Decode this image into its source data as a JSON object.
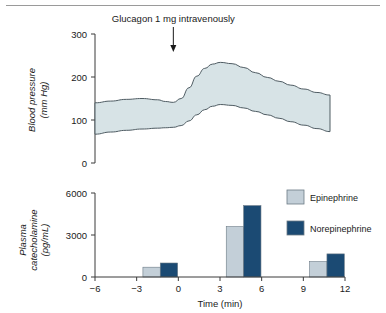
{
  "figure": {
    "annotation": "Glucagon 1 mg intravenously",
    "colors": {
      "band_fill": "#d7e3e6",
      "band_stroke": "#4f5c63",
      "epinephrine": "#c3cfd8",
      "norepinephrine": "#1b4a73",
      "axis": "#3a3a3a",
      "rule": "#9a9a9a"
    }
  },
  "chart_data": [
    {
      "id": "blood-pressure",
      "type": "area",
      "title": "",
      "xlabel": "",
      "ylabel": "Blood pressure (mm Hg)",
      "ylabel_line1": "Blood pressure",
      "ylabel_line2": "(mm Hg)",
      "ytick_labels": [
        "0",
        "100",
        "200",
        "300"
      ],
      "ytick_values": [
        0,
        100,
        200,
        300
      ],
      "ylim": [
        0,
        300
      ],
      "xlim": [
        -6,
        12
      ],
      "grid": false,
      "legend": "none",
      "annotations": [
        {
          "text": "Glucagon 1 mg intravenously",
          "x": 0,
          "arrow": "down"
        }
      ],
      "series": [
        {
          "name": "Systolic",
          "x": [
            -6.0,
            -4.8,
            -3.6,
            -2.4,
            -1.2,
            -0.6,
            0.0,
            0.6,
            1.2,
            1.8,
            2.4,
            3.0,
            3.6,
            4.5,
            5.4,
            6.3,
            7.2,
            8.1,
            9.0,
            10.0,
            11.0,
            12.0
          ],
          "values": [
            140,
            144,
            148,
            150,
            147,
            143,
            141,
            150,
            175,
            202,
            220,
            230,
            234,
            231,
            222,
            210,
            199,
            190,
            181,
            172,
            164,
            158
          ]
        },
        {
          "name": "Diastolic",
          "x": [
            -6.0,
            -4.8,
            -3.6,
            -2.4,
            -1.2,
            -0.6,
            0.0,
            0.6,
            1.2,
            1.8,
            2.4,
            3.0,
            3.6,
            4.5,
            5.4,
            6.3,
            7.2,
            8.1,
            9.0,
            10.0,
            11.0,
            12.0
          ],
          "values": [
            67,
            72,
            76,
            79,
            81,
            82,
            83,
            87,
            98,
            112,
            124,
            132,
            136,
            134,
            128,
            120,
            112,
            104,
            96,
            88,
            80,
            73
          ]
        }
      ]
    },
    {
      "id": "plasma-catecholamine",
      "type": "bar",
      "title": "",
      "xlabel": "Time (min)",
      "ylabel": "Plasma catecholamine (pg/mL)",
      "ylabel_line1": "Plasma",
      "ylabel_line2": "catecholamine",
      "ylabel_line3": "(pg/mL)",
      "ytick_labels": [
        "0",
        "3000",
        "6000"
      ],
      "ytick_values": [
        0,
        3000,
        6000
      ],
      "ylim": [
        0,
        6000
      ],
      "xtick_labels": [
        "−6",
        "−3",
        "0",
        "3",
        "6",
        "9",
        "12"
      ],
      "xtick_values": [
        -6,
        -3,
        0,
        3,
        6,
        9,
        12
      ],
      "xlim": [
        -6,
        12
      ],
      "grid": false,
      "legend": "top-right",
      "categories": [
        "-3 to -2",
        "3 to 4",
        "9 to 10"
      ],
      "bar_x_starts": [
        -2.55,
        3.45,
        9.45
      ],
      "bar_width_min": 1.25,
      "series": [
        {
          "name": "Epinephrine",
          "color": "#c3cfd8",
          "values": [
            700,
            3600,
            1100
          ]
        },
        {
          "name": "Norepinephrine",
          "color": "#1b4a73",
          "values": [
            1000,
            5100,
            1650
          ]
        }
      ]
    }
  ]
}
